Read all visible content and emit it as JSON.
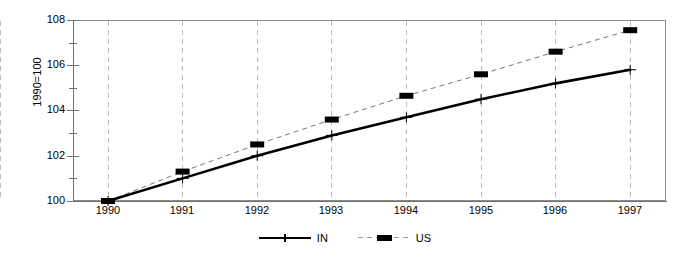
{
  "chart_data": {
    "type": "line",
    "title": "",
    "subtitle": "",
    "xlabel": "",
    "ylabel": "1990=100",
    "categories": [
      "1990",
      "1991",
      "1992",
      "1993",
      "1994",
      "1995",
      "1996",
      "1997"
    ],
    "x": [
      1990,
      1991,
      1992,
      1993,
      1994,
      1995,
      1996,
      1997
    ],
    "ylim": [
      100,
      108
    ],
    "xlim": [
      1989.5,
      1997.6
    ],
    "yticks": [
      100,
      102,
      104,
      106,
      108
    ],
    "yticks_minor": [
      101,
      103,
      105,
      107
    ],
    "grid": "vertical-dashed",
    "legend_position": "bottom-center",
    "series": [
      {
        "name": "IN",
        "style": "solid",
        "marker": "cross",
        "color": "#000000",
        "values": [
          100.0,
          101.0,
          102.0,
          102.9,
          103.7,
          104.5,
          105.2,
          105.8
        ]
      },
      {
        "name": "US",
        "style": "dashed",
        "marker": "square",
        "color": "#000000",
        "values": [
          100.0,
          101.3,
          102.5,
          103.6,
          104.65,
          105.6,
          106.6,
          107.55
        ]
      }
    ],
    "ytick_labels": [
      "100",
      "102",
      "104",
      "106",
      "108"
    ],
    "xtick_labels": [
      "1990",
      "1991",
      "1992",
      "1993",
      "1994",
      "1995",
      "1996",
      "1997"
    ],
    "legend_entries": [
      {
        "label": "IN",
        "marker": "cross-marker",
        "line": "solid-line"
      },
      {
        "label": "US",
        "marker": "square-marker",
        "line": "dashed-line"
      }
    ]
  }
}
